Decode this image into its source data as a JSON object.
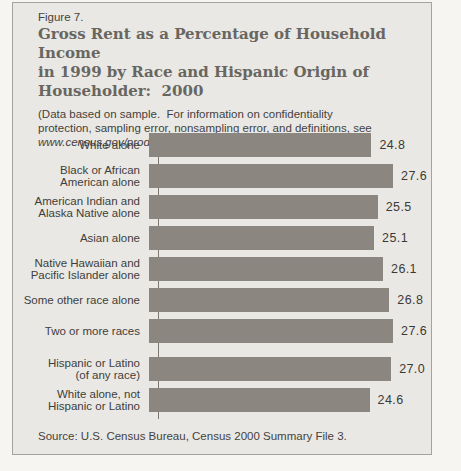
{
  "figure": {
    "label": "Figure 7.",
    "title": "Gross Rent as a Percentage of Household Income\nin 1999 by Race and Hispanic Origin of\nHouseholder:  2000",
    "note_text": "(Data based on sample.  For information on confidentiality\nprotection, sampling error, nonsampling error, and definitions, see\n",
    "note_url": "www.census.gov/prod/cen2000/doc/sf3.pdf",
    "note_suffix": ")",
    "source": "Source: U.S. Census Bureau, Census 2000 Summary File 3."
  },
  "colors": {
    "bar": "#8b8680",
    "panel_background": "#eae8e4",
    "page_background": "#f6f5f2",
    "panel_border": "#a6a39e",
    "title_text": "#686660",
    "body_text": "#44423e"
  },
  "chart": {
    "rows": [
      {
        "label": "White alone",
        "value": 24.8,
        "value_label": "24.8"
      },
      {
        "label": "Black or African\nAmerican alone",
        "value": 27.6,
        "value_label": "27.6"
      },
      {
        "label": "American Indian and\nAlaska Native alone",
        "value": 25.5,
        "value_label": "25.5"
      },
      {
        "label": "Asian alone",
        "value": 25.1,
        "value_label": "25.1"
      },
      {
        "label": "Native Hawaiian and\nPacific Islander alone",
        "value": 26.1,
        "value_label": "26.1"
      },
      {
        "label": "Some other race alone",
        "value": 26.8,
        "value_label": "26.8"
      },
      {
        "label": "Two or more races",
        "value": 27.6,
        "value_label": "27.6"
      },
      {
        "label": "Hispanic or Latino\n(of any race)",
        "value": 27.0,
        "value_label": "27.0"
      },
      {
        "label": "White alone, not\nHispanic or Latino",
        "value": 24.6,
        "value_label": "24.6"
      }
    ]
  },
  "chart_data": {
    "type": "bar",
    "orientation": "horizontal",
    "title": "Gross Rent as a Percentage of Household Income in 1999 by Race and Hispanic Origin of Householder: 2000",
    "subtitle": "Figure 7. (Data based on sample. For information on confidentiality protection, sampling error, nonsampling error, and definitions, see www.census.gov/prod/cen2000/doc/sf3.pdf)",
    "categories": [
      "White alone",
      "Black or African American alone",
      "American Indian and Alaska Native alone",
      "Asian alone",
      "Native Hawaiian and Pacific Islander alone",
      "Some other race alone",
      "Two or more races",
      "Hispanic or Latino (of any race)",
      "White alone, not Hispanic or Latino"
    ],
    "values": [
      24.8,
      27.6,
      25.5,
      25.1,
      26.1,
      26.8,
      27.6,
      27.0,
      24.6
    ],
    "xlabel": "",
    "ylabel": "",
    "xlim": [
      0,
      31
    ],
    "grid": false,
    "legend": false,
    "data_labels_shown": true,
    "group_gap_after_index": 6,
    "source": "Source: U.S. Census Bureau, Census 2000 Summary File 3."
  }
}
